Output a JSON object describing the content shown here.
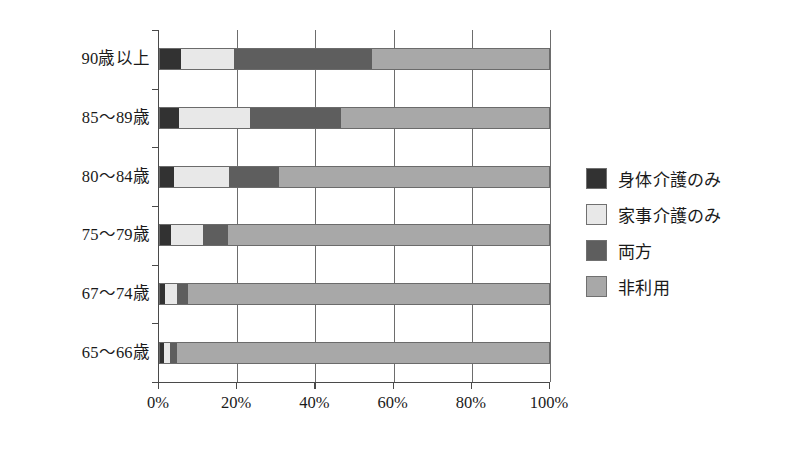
{
  "chart_data": {
    "type": "bar",
    "orientation": "horizontal",
    "stacked": true,
    "normalized": true,
    "title": "",
    "subtitle": "",
    "xlabel": "",
    "ylabel": "",
    "xlim": [
      0,
      100
    ],
    "xticks": [
      0,
      20,
      40,
      60,
      80,
      100
    ],
    "xticklabels": [
      "0%",
      "20%",
      "40%",
      "60%",
      "80%",
      "100%"
    ],
    "grid": true,
    "grid_axis": "x",
    "legend_position": "right",
    "categories": [
      "90歳以上",
      "85〜89歳",
      "80〜84歳",
      "75〜79歳",
      "67〜74歳",
      "65〜66歳"
    ],
    "series": [
      {
        "name": "身体介護のみ",
        "color": "#323232",
        "values": [
          5.6,
          5.1,
          3.8,
          3.1,
          1.5,
          1.3
        ]
      },
      {
        "name": "家事介護のみ",
        "color": "#e8e8e8",
        "values": [
          13.6,
          18.2,
          14.1,
          8.2,
          3.1,
          1.5
        ]
      },
      {
        "name": "両方",
        "color": "#5e5e5e",
        "values": [
          35.3,
          23.3,
          12.8,
          6.4,
          2.8,
          1.8
        ]
      },
      {
        "name": "非利用",
        "color": "#a8a8a8",
        "values": [
          45.5,
          53.4,
          69.3,
          82.3,
          92.6,
          95.4
        ]
      }
    ]
  },
  "legend": {
    "items": [
      {
        "label": "身体介護のみ",
        "color": "#323232"
      },
      {
        "label": "家事介護のみ",
        "color": "#e8e8e8"
      },
      {
        "label": "両方",
        "color": "#5e5e5e"
      },
      {
        "label": "非利用",
        "color": "#a8a8a8"
      }
    ]
  }
}
